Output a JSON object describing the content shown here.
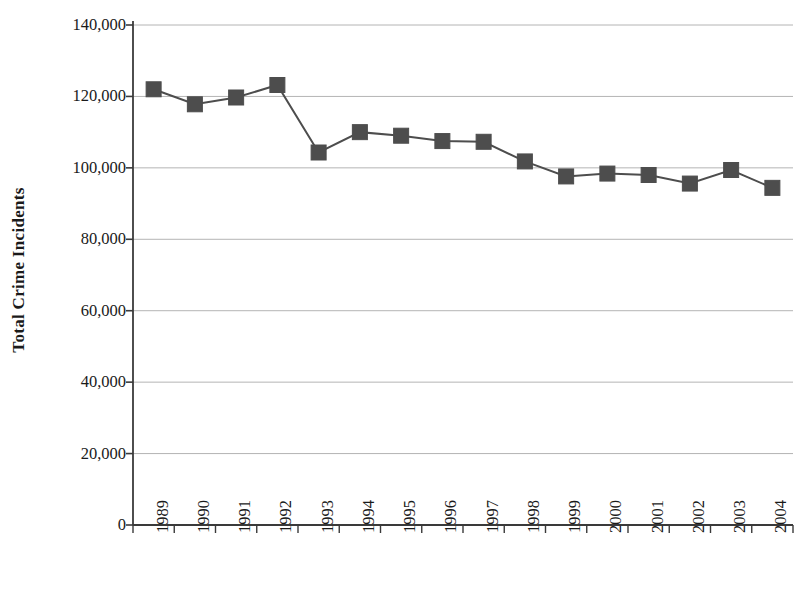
{
  "chart_data": {
    "type": "line",
    "title": "",
    "xlabel": "",
    "ylabel": "Total Crime Incidents",
    "categories": [
      "1989",
      "1990",
      "1991",
      "1992",
      "1993",
      "1994",
      "1995",
      "1996",
      "1997",
      "1998",
      "1999",
      "2000",
      "2001",
      "2002",
      "2003",
      "2004"
    ],
    "values": [
      122000,
      117800,
      119700,
      123200,
      104300,
      110000,
      109000,
      107500,
      107300,
      101800,
      97600,
      98400,
      98000,
      95600,
      99400,
      94400
    ],
    "series": [
      {
        "name": "Total Crime Incidents",
        "values": [
          122000,
          117800,
          119700,
          123200,
          104300,
          110000,
          109000,
          107500,
          107300,
          101800,
          97600,
          98400,
          98000,
          95600,
          99400,
          94400
        ]
      }
    ],
    "ylim": [
      0,
      140000
    ],
    "yticks": [
      0,
      20000,
      40000,
      60000,
      80000,
      100000,
      120000,
      140000
    ],
    "ytick_labels": [
      "0",
      "20,000",
      "40,000",
      "60,000",
      "80,000",
      "100,000",
      "120,000",
      "140,000"
    ],
    "grid": true,
    "grid_axis": "y",
    "legend": false,
    "legend_position": "none",
    "marker": "square",
    "marker_color": "#4d4d4d",
    "line_color": "#4d4d4d",
    "grid_color": "#b4b4b4",
    "axis_color": "#3a3a3a",
    "background_color": "#ffffff",
    "xtick_rotation": -90
  }
}
